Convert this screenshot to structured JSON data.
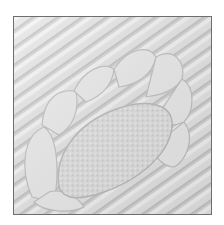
{
  "image": {
    "subject": "white whole-cloth quilt detail with feather motif and stippled center",
    "colors": {
      "background": "#ffffff",
      "fabric": "#e4e4e4",
      "shadow": "#c4c4c4",
      "highlight": "#f6f6f6",
      "border": "#6e6e6e"
    }
  }
}
